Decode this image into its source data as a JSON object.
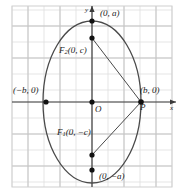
{
  "figure": {
    "width": 185,
    "height": 193,
    "background": "#ffffff",
    "grid_color": "#d8d8d8",
    "grid_major_color": "#bdbdbd",
    "axis_color": "#3a3a3a",
    "curve_color": "#3a3a3a",
    "point_color": "#111111",
    "grid_spacing_px": 16
  },
  "axes": {
    "x_label": "x",
    "y_label": "y",
    "origin_label": "O",
    "origin_px": {
      "x": 92,
      "y": 102
    }
  },
  "points": [
    {
      "name": "top-vertex",
      "label": "(0, a)",
      "px": {
        "x": 92,
        "y": 21
      },
      "label_px": {
        "x": 100,
        "y": 12
      }
    },
    {
      "name": "bottom-vertex",
      "label": "(0, −a)",
      "px": {
        "x": 92,
        "y": 170
      },
      "label_px": {
        "x": 99,
        "y": 174
      }
    },
    {
      "name": "left-vertex",
      "label": "(−b, 0)",
      "px": {
        "x": 46,
        "y": 102
      },
      "label_px": {
        "x": 14,
        "y": 88
      }
    },
    {
      "name": "right-vertex",
      "label": "(b, 0)",
      "px": {
        "x": 141,
        "y": 102
      },
      "label_px": {
        "x": 140,
        "y": 88
      }
    },
    {
      "name": "focus-upper",
      "label": "F",
      "sub": "2",
      "coords": "(0, c)",
      "px": {
        "x": 92,
        "y": 38
      },
      "label_px": {
        "x": 60,
        "y": 48
      }
    },
    {
      "name": "focus-lower",
      "label": "F",
      "sub": "1",
      "coords": "(0, −c)",
      "px": {
        "x": 92,
        "y": 155
      },
      "label_px": {
        "x": 58,
        "y": 130
      }
    },
    {
      "name": "point-P",
      "label": "P",
      "px": {
        "x": 141,
        "y": 102
      },
      "label_px": {
        "x": 140,
        "y": 103
      }
    }
  ],
  "ellipse": {
    "center_px": {
      "x": 92,
      "y": 102
    },
    "semi_major_px": 81,
    "semi_minor_px": 49,
    "orientation": "vertical"
  },
  "segments": [
    {
      "name": "segment-F2-P",
      "from": "focus-upper",
      "to": "point-P"
    },
    {
      "name": "segment-F1-P",
      "from": "focus-lower",
      "to": "point-P"
    }
  ]
}
